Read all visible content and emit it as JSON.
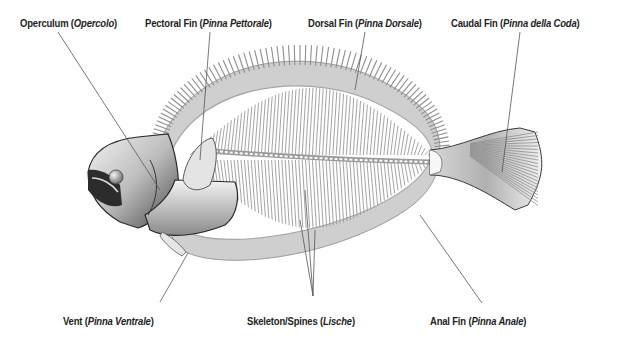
{
  "labels": {
    "operculum": {
      "name": "Operculum",
      "translation": "Opercolo"
    },
    "pectoral_fin": {
      "name": "Pectoral Fin",
      "translation": "Pinna Pettorale"
    },
    "dorsal_fin": {
      "name": "Dorsal Fin",
      "translation": "Pinna Dorsale"
    },
    "caudal_fin": {
      "name": "Caudal Fin",
      "translation": "Pinna della Coda"
    },
    "vent": {
      "name": "Vent",
      "translation": "Pinna Ventrale"
    },
    "skeleton": {
      "name": "Skeleton/Spines",
      "translation": "Lische"
    },
    "anal_fin": {
      "name": "Anal Fin",
      "translation": "Pinna Anale"
    }
  },
  "colors": {
    "background": "#ffffff",
    "text": "#1e1e1e",
    "leader_line": "#555555",
    "fin_ray": "#9a9a9a",
    "body_dark": "#3a3a3a",
    "body_light": "#e6e6e6"
  }
}
